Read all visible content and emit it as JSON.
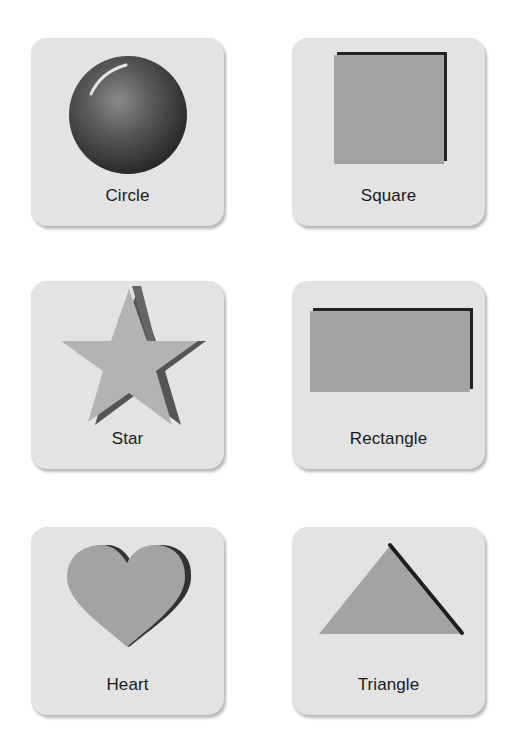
{
  "cards": [
    {
      "id": "circle",
      "label": "Circle",
      "icon": "circle-icon"
    },
    {
      "id": "square",
      "label": "Square",
      "icon": "square-icon"
    },
    {
      "id": "star",
      "label": "Star",
      "icon": "star-icon"
    },
    {
      "id": "rectangle",
      "label": "Rectangle",
      "icon": "rectangle-icon"
    },
    {
      "id": "heart",
      "label": "Heart",
      "icon": "heart-icon"
    },
    {
      "id": "triangle",
      "label": "Triangle",
      "icon": "triangle-icon"
    }
  ],
  "colors": {
    "card_background": "#e3e3e3",
    "shape_fill": "#a3a3a3",
    "shape_shadow": "#3a3a3a",
    "sphere_dark": "#2e2e2e",
    "sphere_mid": "#6a6a6a",
    "label_text": "#1a1a1a"
  }
}
